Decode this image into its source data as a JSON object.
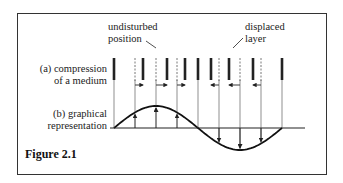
{
  "labels": {
    "undisturbed": "undisturbed",
    "position": "position",
    "displaced": "displaced",
    "layer": "layer",
    "a_line1": "(a) compression",
    "a_line2": "of a medium",
    "b_line1": "(b) graphical",
    "b_line2": "representation"
  },
  "figure_caption": "Figure 2.1",
  "diagram": {
    "undisturbed_positions_x": [
      114,
      135,
      156,
      177,
      198,
      219,
      240,
      261,
      282
    ],
    "displacements": [
      0,
      8,
      11,
      8,
      0,
      -8,
      -11,
      -8,
      0
    ],
    "axis_y": 128,
    "amplitude": 22
  }
}
